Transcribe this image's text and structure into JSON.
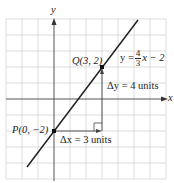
{
  "diagram": {
    "axes": {
      "x_label": "x",
      "y_label": "y"
    },
    "line": {
      "equation_prefix": "y =",
      "slope_num": "4",
      "slope_den": "3",
      "equation_suffix": "x − 2",
      "slope": 1.3333,
      "intercept": -2
    },
    "points": [
      {
        "name": "P",
        "label": "P(0, −2)",
        "x": 0,
        "y": -2
      },
      {
        "name": "Q",
        "label": "Q(3, 2)",
        "x": 3,
        "y": 2
      }
    ],
    "annotations": {
      "delta_x": "Δx = 3 units",
      "delta_y": "Δy = 4 units"
    },
    "grid": {
      "x_range": [
        -3,
        7
      ],
      "y_range": [
        -5,
        5
      ],
      "cell_px": 16
    },
    "colors": {
      "grid": "#d4d4d4",
      "axis": "#555555",
      "line": "#222222",
      "arrow": "#444444"
    }
  }
}
